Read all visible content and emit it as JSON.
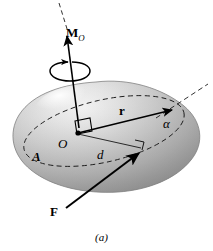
{
  "figure": {
    "caption": "(a)",
    "kind": "free-body-diagram",
    "background_color": "#ffffff",
    "ink_color": "#000000",
    "body_color_light": "#f2f2f2",
    "body_color_mid": "#b4b4b4",
    "body_color_dark": "#787878"
  },
  "labels": {
    "moment_symbol": "M",
    "moment_subscript": "O",
    "position_vector": "r",
    "angle": "α",
    "origin": "O",
    "moment_arm": "d",
    "point_a": "A",
    "force": "F",
    "caption": "(a)"
  },
  "elements": {
    "body_name": "rigid-body",
    "axis_name": "moment-axis",
    "rotation_name": "rotation-sense-arrow",
    "moment_vector_name": "moment-vector",
    "force_vector_name": "force-vector",
    "position_vector_name": "position-vector",
    "moment_arm_name": "moment-arm-line",
    "section_ellipse_name": "section-plane-ellipse",
    "line_of_action_name": "line-of-action",
    "right_angle_origin_name": "right-angle-marker-origin",
    "right_angle_arm_name": "right-angle-marker-moment-arm"
  }
}
